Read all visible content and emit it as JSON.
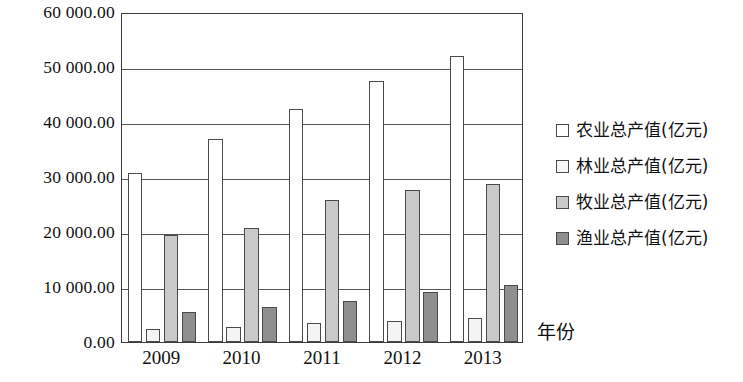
{
  "chart_data": {
    "type": "bar",
    "title": "",
    "xlabel": "年份",
    "ylabel": "",
    "categories": [
      "2009",
      "2010",
      "2011",
      "2012",
      "2013"
    ],
    "series": [
      {
        "name": "农业总产值(亿元)",
        "color": "#ffffff",
        "values": [
          30800,
          37000,
          42300,
          47400,
          52000
        ]
      },
      {
        "name": "林业总产值(亿元)",
        "color": "#f4f4f2",
        "values": [
          2400,
          2700,
          3400,
          3800,
          4300
        ]
      },
      {
        "name": "牧业总产值(亿元)",
        "color": "#c9c9c9",
        "values": [
          19500,
          20800,
          25800,
          27600,
          28800
        ]
      },
      {
        "name": "渔业总产值(亿元)",
        "color": "#8f8f8f",
        "values": [
          5500,
          6300,
          7500,
          9100,
          10300
        ]
      }
    ],
    "ylim": [
      0,
      60000
    ],
    "ytick_labels": [
      "0.00",
      "10 000.00",
      "20 000.00",
      "30 000.00",
      "40 000.00",
      "50 000.00",
      "60 000.00"
    ],
    "ytick_values": [
      0,
      10000,
      20000,
      30000,
      40000,
      50000,
      60000
    ],
    "grid": true,
    "legend_position": "right"
  }
}
